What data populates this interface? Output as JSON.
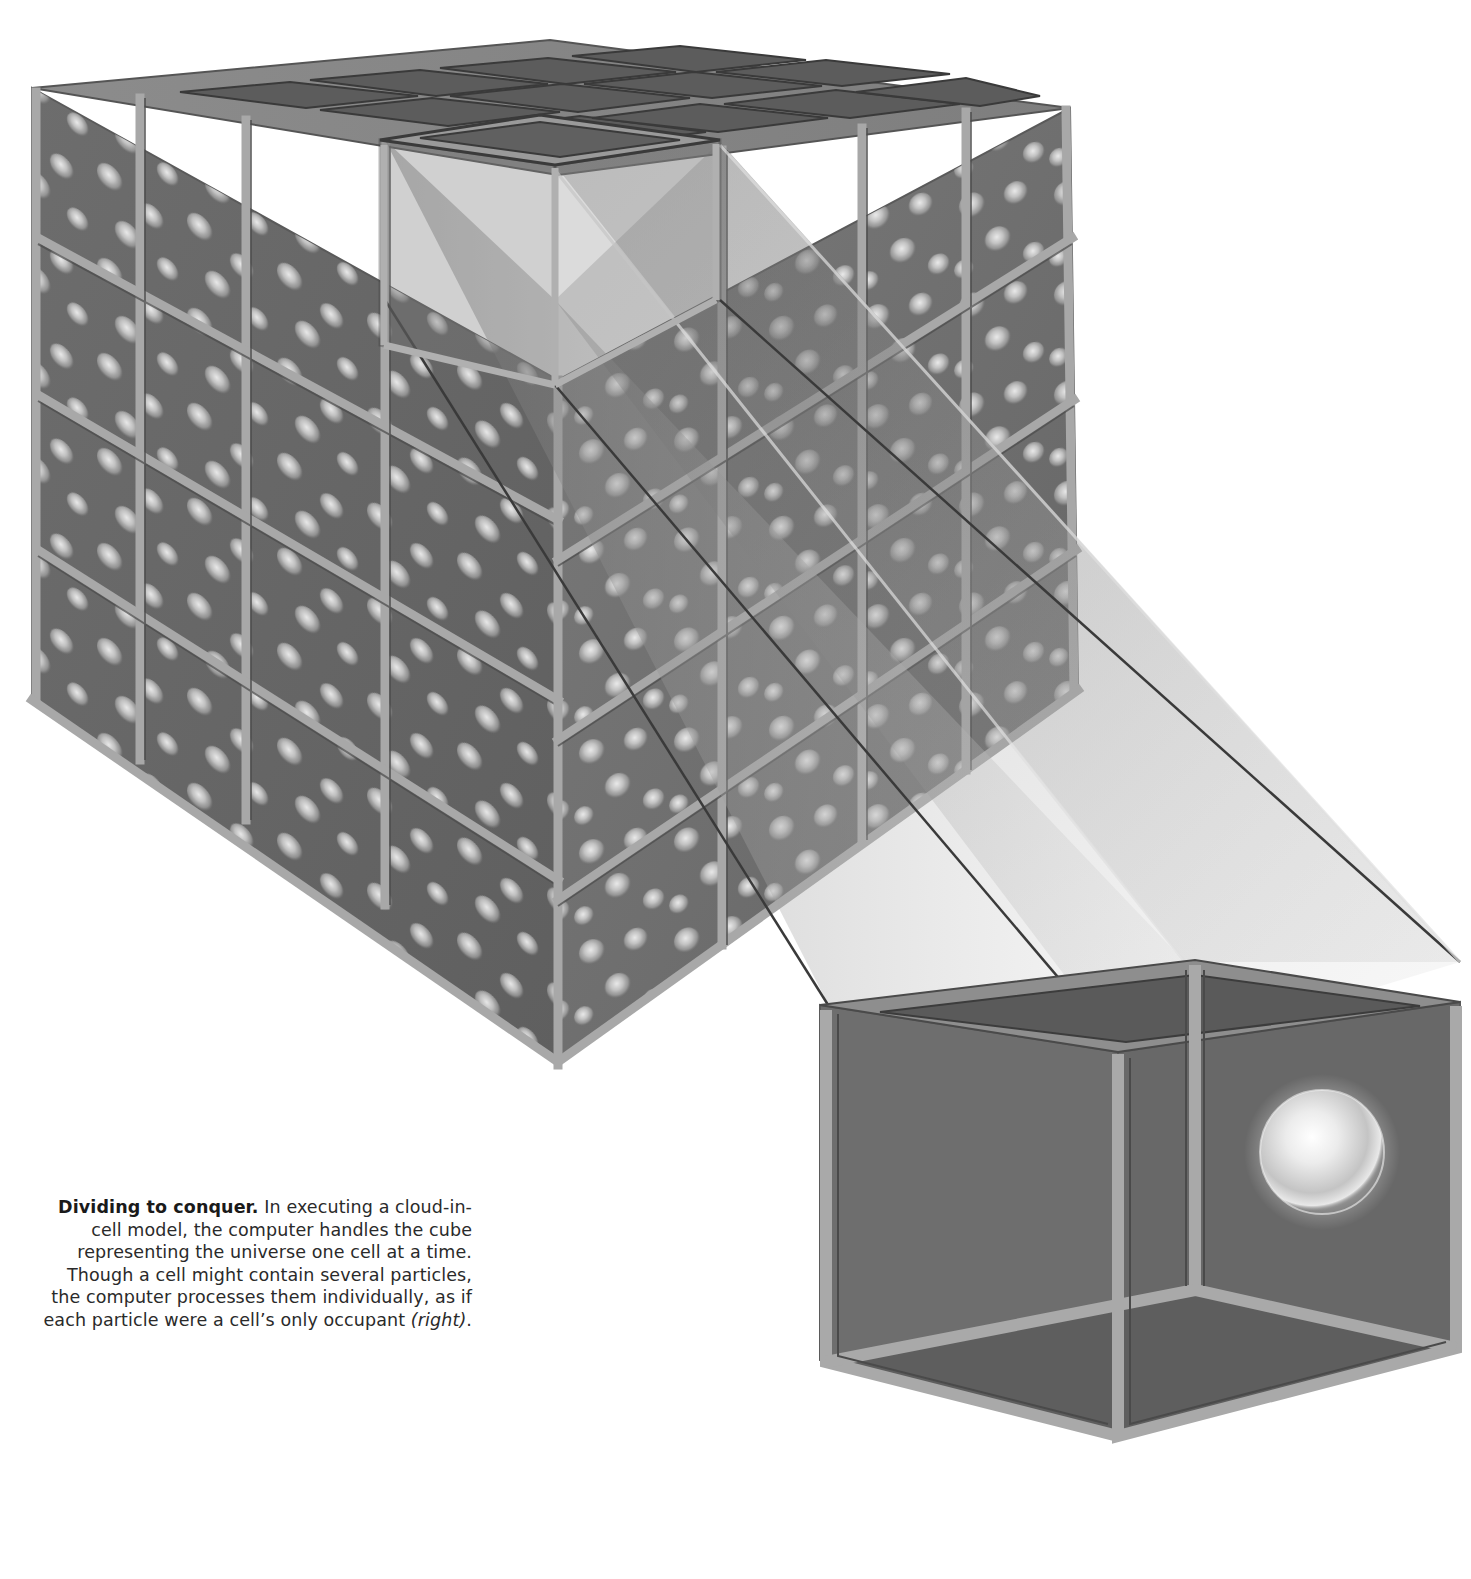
{
  "figure": {
    "title": "Dividing to conquer.",
    "big_cube": {
      "grid": "4 x 4 x 4",
      "cells_per_edge": 4,
      "content": "many glowing particles"
    },
    "highlighted_cell": {
      "position": "top layer, front column"
    },
    "enlarged_cell": {
      "particle_count": 1
    },
    "colors": {
      "background": "#ffffff",
      "frame": "#9a9a9a",
      "frame_dark": "#4a4a4a",
      "glass": "#6e6e6e",
      "particle": "#e8e8e8",
      "text": "#2a2a2a"
    }
  },
  "caption": {
    "lead": "Dividing to conquer.",
    "body": " In executing a cloud-in-cell model, the computer handles the cube representing the universe one cell at a time. Though a cell might contain several particles, the computer processes them individually, as if each particle were a cell’s only occupant ",
    "ref": "(right)",
    "end": "."
  }
}
